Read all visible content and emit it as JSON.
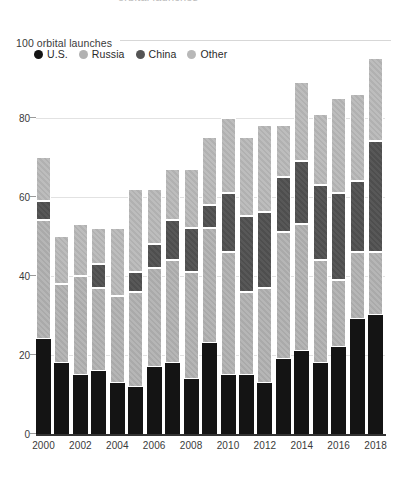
{
  "header": {
    "clipped_title_text": "orbital launches",
    "unit_label": "100 orbital launches"
  },
  "legend": {
    "position": "top-left",
    "items": [
      {
        "label": "U.S.",
        "color": "#141414",
        "key": "us"
      },
      {
        "label": "Russia",
        "color": "#b2b2b2",
        "key": "russia"
      },
      {
        "label": "China",
        "color": "#545454",
        "key": "china"
      },
      {
        "label": "Other",
        "color": "#b8b8b8",
        "key": "other"
      }
    ]
  },
  "chart_data": {
    "type": "bar",
    "stacked": true,
    "title": "",
    "subtitle": "",
    "xlabel": "",
    "ylabel": "100 orbital launches",
    "ylim": [
      0,
      100
    ],
    "yticks": [
      0,
      20,
      40,
      60,
      80
    ],
    "ytick_labels": [
      "0",
      "20",
      "40",
      "60",
      "80"
    ],
    "grid": true,
    "grid_axis": "y",
    "legend_position": "top-left",
    "categories": [
      "2000",
      "2001",
      "2002",
      "2003",
      "2004",
      "2005",
      "2006",
      "2007",
      "2008",
      "2009",
      "2010",
      "2011",
      "2012",
      "2013",
      "2014",
      "2015",
      "2016",
      "2017",
      "2018"
    ],
    "xtick_labels": [
      "2000",
      "2002",
      "2004",
      "2006",
      "2008",
      "2010",
      "2012",
      "2014",
      "2016",
      "2018"
    ],
    "series": [
      {
        "name": "U.S.",
        "color": "#141414",
        "values": [
          24,
          18,
          15,
          16,
          13,
          12,
          17,
          18,
          14,
          23,
          15,
          15,
          13,
          19,
          21,
          18,
          22,
          29,
          30
        ]
      },
      {
        "name": "Russia",
        "color": "#b2b2b2",
        "values": [
          30,
          20,
          25,
          21,
          22,
          24,
          25,
          26,
          27,
          29,
          31,
          21,
          24,
          32,
          32,
          26,
          17,
          17,
          16
        ]
      },
      {
        "name": "China",
        "color": "#545454",
        "values": [
          5,
          0,
          0,
          6,
          0,
          5,
          6,
          10,
          11,
          6,
          15,
          19,
          19,
          14,
          16,
          19,
          22,
          18,
          28
        ]
      },
      {
        "name": "Other",
        "color": "#b8b8b8",
        "values": [
          11,
          12,
          13,
          9,
          17,
          21,
          14,
          13,
          15,
          17,
          19,
          20,
          22,
          13,
          20,
          18,
          24,
          22,
          21
        ]
      }
    ],
    "totals": [
      70,
      50,
      53,
      52,
      52,
      62,
      62,
      67,
      67,
      75,
      80,
      75,
      78,
      78,
      89,
      81,
      85,
      86,
      95
    ]
  },
  "axes": {
    "y_top_value": 100,
    "y_bottom_value": 0
  }
}
